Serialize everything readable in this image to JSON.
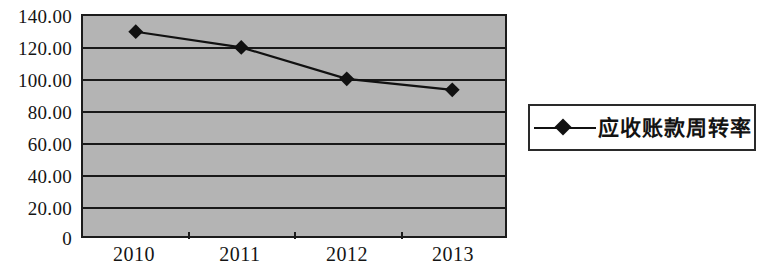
{
  "chart_data": {
    "type": "line",
    "title": "",
    "subtitle": "",
    "xlabel": "",
    "ylabel": "",
    "categories": [
      "2010",
      "2011",
      "2012",
      "2013"
    ],
    "series": [
      {
        "name": "应收账款周转率",
        "values": [
          130.0,
          120.0,
          100.0,
          93.0
        ],
        "marker": "diamond",
        "color": "#111111"
      }
    ],
    "ylim": [
      0,
      140
    ],
    "ytick_labels": [
      "140.00",
      "120.00",
      "100.00",
      "80.00",
      "60.00",
      "40.00",
      "20.00",
      "0"
    ],
    "ytick_values": [
      140,
      120,
      100,
      80,
      60,
      40,
      20,
      0
    ],
    "grid": true,
    "grid_axis": "y",
    "legend_position": "right",
    "plot_background": "#b4b4b4",
    "axis_color": "#1b1b1b"
  },
  "legend": {
    "entries": [
      {
        "label": "应收账款周转率"
      }
    ]
  }
}
